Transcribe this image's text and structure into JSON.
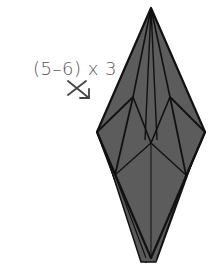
{
  "diagram": {
    "step_label": "(5–6) x 3",
    "fill_color": "#5a5a5a",
    "line_color": "#111111",
    "arrow_color": "#444444"
  }
}
